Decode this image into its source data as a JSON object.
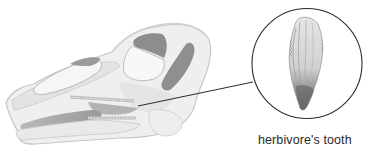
{
  "figure": {
    "callout_label": "herbivore's tooth",
    "colors": {
      "bone_light": "#efefef",
      "bone_mid": "#d9d9d9",
      "bone_outline": "#c4c4c4",
      "opening_dark": "#8a8a8a",
      "callout_line": "#2b2b2b",
      "text": "#2a2a2a"
    }
  }
}
